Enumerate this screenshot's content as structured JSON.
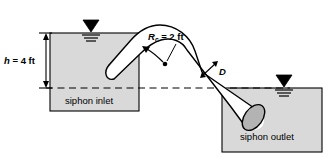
{
  "figure": {
    "background_color": "#ffffff",
    "line_color": "#000000",
    "fill_tank": "#d9d9d9",
    "fill_pipe": "#ffffff",
    "fill_pipe_end": "#b3b3b3"
  },
  "labels": {
    "head": {
      "symbol": "h",
      "equals": " = 4 ft",
      "full": "h = 4 ft"
    },
    "radius": {
      "symbol": "R",
      "subscript": "c",
      "equals": " = 2 ft",
      "full": "Rc = 2 ft"
    },
    "diameter": {
      "symbol": "D"
    },
    "inlet_tank": "siphon inlet",
    "outlet_tank": "siphon outlet"
  },
  "symbols": {
    "free_surface_inlet": "free-surface-triangle",
    "free_surface_outlet": "free-surface-triangle",
    "datum_line": "dashed-datum-line",
    "dimension_arrow": "double-headed-arrow",
    "radius_arrow": "leader-arrow-with-center-dot"
  }
}
